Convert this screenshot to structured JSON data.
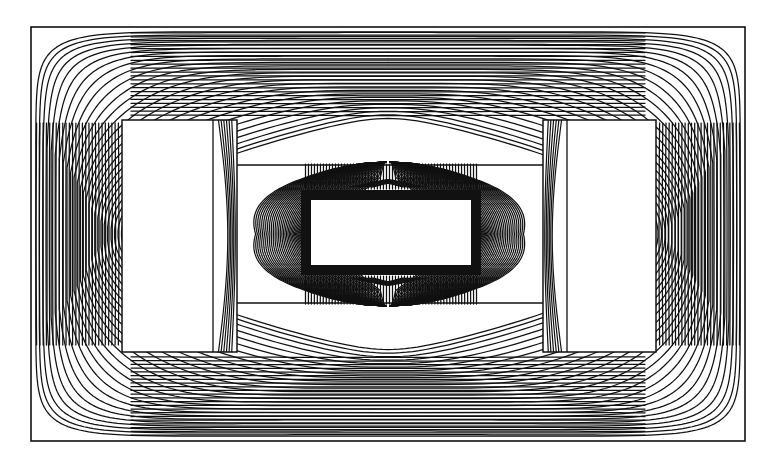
{
  "figure": {
    "caption": "",
    "background_color": "#ffffff",
    "line_color": "#111111",
    "width": 781,
    "height": 463
  },
  "chart_data": {
    "type": "line",
    "subtitle": "",
    "xlabel": "",
    "ylabel": "",
    "xlim": [
      0,
      781
    ],
    "ylim": [
      0,
      463
    ],
    "grid": false,
    "legend": "none",
    "axis_visible": false,
    "tick_labels_x": [],
    "tick_labels_y": [],
    "annotations": [],
    "outer_boundary": {
      "name": "solution-domain-boundary",
      "x": 31,
      "y": 27,
      "width": 714,
      "height": 414,
      "stroke_width": 1.6
    },
    "regions": [
      {
        "name": "left-window",
        "role": "coil-window-white-region",
        "x": 122,
        "y": 120,
        "width": 115,
        "height": 232,
        "fill": "#ffffff",
        "stroke": "#111111"
      },
      {
        "name": "right-window",
        "role": "coil-window-white-region",
        "x": 543,
        "y": 120,
        "width": 113,
        "height": 232,
        "fill": "#ffffff",
        "stroke": "#111111"
      },
      {
        "name": "left-window-inner-divider",
        "role": "winding-boundary-line",
        "x1": 213,
        "y1": 120,
        "x2": 213,
        "y2": 352
      },
      {
        "name": "right-window-inner-divider",
        "role": "winding-boundary-line",
        "x1": 567,
        "y1": 120,
        "x2": 567,
        "y2": 352
      },
      {
        "name": "centre-core-block",
        "role": "inner-core-dark-rectangle",
        "x": 301,
        "y": 190,
        "width": 180,
        "height": 85,
        "fill": "#ffffff",
        "stroke": "#111111",
        "stroke_width": 10
      },
      {
        "name": "centre-core-window",
        "role": "inner-core-white-interior",
        "x": 311,
        "y": 200,
        "width": 160,
        "height": 65,
        "fill": "#ffffff"
      },
      {
        "name": "upper-yoke-gap-line",
        "role": "air-gap-horizontal-boundary",
        "x1": 237,
        "y1": 165,
        "x2": 543,
        "y2": 165
      },
      {
        "name": "lower-yoke-gap-line",
        "role": "air-gap-horizontal-boundary",
        "x1": 237,
        "y1": 303,
        "x2": 543,
        "y2": 303
      }
    ],
    "contour_family": {
      "count_outer_loops": 26,
      "count_centre_fan_lines": 44,
      "count_leg_vertical_lines": 30,
      "levels_normalized": [
        0.0,
        0.04,
        0.08,
        0.12,
        0.15,
        0.19,
        0.23,
        0.27,
        0.31,
        0.35,
        0.38,
        0.42,
        0.46,
        0.5,
        0.54,
        0.58,
        0.62,
        0.65,
        0.69,
        0.73,
        0.77,
        0.81,
        0.85,
        0.88,
        0.92,
        0.96,
        1.0
      ],
      "symmetry": "mirror about vertical centre line x=388 and horizontal centre line y=233",
      "stroke_width": 1.25
    }
  }
}
